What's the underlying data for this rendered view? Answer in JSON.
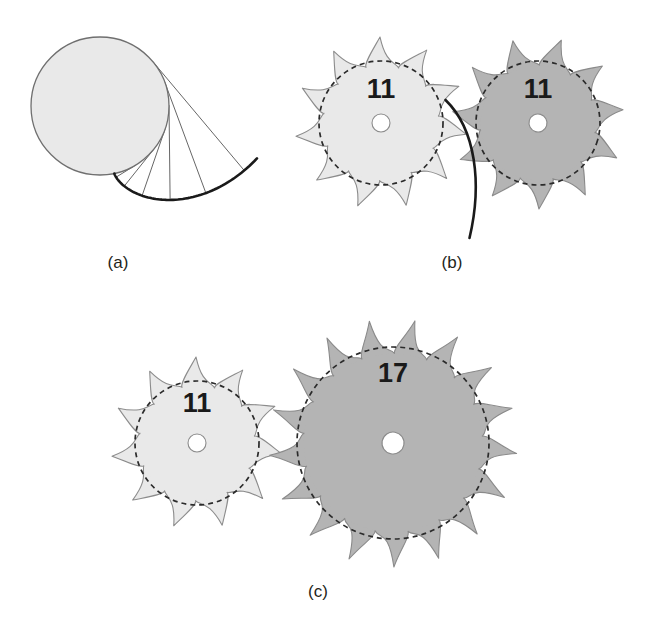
{
  "figure": {
    "background_color": "#ffffff",
    "width": 653,
    "height": 633
  },
  "palette": {
    "light_gear_fill": "#e9e9e9",
    "light_gear_stroke": "#8c8c8c",
    "dark_gear_fill": "#b4b4b4",
    "dark_gear_stroke": "#8a8a8a",
    "pitch_circle_stroke": "#2b2b2b",
    "hub_fill": "#ffffff",
    "base_circle_fill": "#e9e9e9",
    "base_circle_stroke": "#6f6f6f",
    "involute_curve_stroke": "#1a1a1a",
    "tangent_line_stroke": "#555555",
    "label_color": "#231f20"
  },
  "panels": [
    {
      "id": "a",
      "label": "(a)",
      "label_x": 118,
      "label_y": 268,
      "description": "Involute curve generated by unwrapping a taut line from a base circle",
      "base_circle": {
        "cx": 100,
        "cy": 106,
        "r": 69
      },
      "involute": {
        "stroke_width": 2.6,
        "start_angle_deg": 0,
        "end_angle_deg": 125,
        "tangent_count": 6
      },
      "tangent_lines": 6
    },
    {
      "id": "b",
      "label": "(b)",
      "label_x": 452,
      "label_y": 268,
      "description": "An 11-tooth gear meshing with another 11-tooth gear",
      "gears": [
        {
          "name": "left-gear",
          "teeth": 11,
          "teeth_label": "11",
          "cx": 381,
          "cy": 123,
          "pitch_radius": 62,
          "tip_radius": 86,
          "hub_radius": 9,
          "shade": "light",
          "phase_deg": 0,
          "label_x": 381,
          "label_y": 98
        },
        {
          "name": "right-gear",
          "teeth": 11,
          "teeth_label": "11",
          "cx": 538,
          "cy": 123,
          "pitch_radius": 62,
          "tip_radius": 86,
          "hub_radius": 9,
          "shade": "dark",
          "phase_deg": 16.4,
          "label_x": 538,
          "label_y": 98
        }
      ],
      "contact_curve": {
        "stroke_width": 2.6
      }
    },
    {
      "id": "c",
      "label": "(c)",
      "label_x": 318,
      "label_y": 597,
      "description": "An 11-tooth gear meshing with a 17-tooth gear",
      "gears": [
        {
          "name": "small-gear",
          "teeth": 11,
          "teeth_label": "11",
          "cx": 197,
          "cy": 443,
          "pitch_radius": 62,
          "tip_radius": 86,
          "hub_radius": 9,
          "shade": "light",
          "phase_deg": 0,
          "label_x": 197,
          "label_y": 412
        },
        {
          "name": "large-gear",
          "teeth": 17,
          "teeth_label": "17",
          "cx": 393,
          "cy": 443,
          "pitch_radius": 96,
          "tip_radius": 124,
          "hub_radius": 11,
          "shade": "dark",
          "phase_deg": 10.6,
          "label_x": 393,
          "label_y": 382
        }
      ]
    }
  ]
}
